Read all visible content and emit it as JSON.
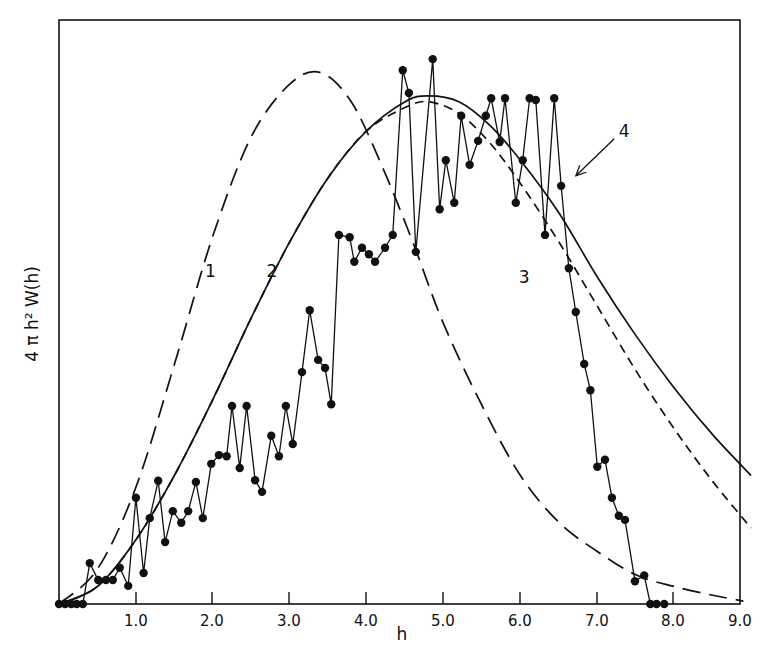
{
  "chart_data": {
    "type": "line",
    "title": "",
    "xlabel": "h",
    "ylabel": "4 π h² W(h)",
    "xlim": [
      0,
      9.0
    ],
    "ylim": [
      0,
      100
    ],
    "y_units": "relative (arbitrary, no tick labels shown)",
    "grid": false,
    "legend": "inline numeric labels 1-4",
    "x_ticks": [
      "1.0",
      "2.0",
      "3.0",
      "4.0",
      "5.0",
      "6.0",
      "7.0",
      "8.0",
      "9.0"
    ],
    "series": [
      {
        "name": "1",
        "style": "long-dashed",
        "description": "bell curve peaking near h=3.4",
        "x": [
          0,
          0.5,
          1.0,
          1.5,
          2.0,
          2.5,
          3.0,
          3.4,
          3.8,
          4.2,
          4.6,
          5.0,
          5.5,
          6.0,
          6.5,
          7.0,
          7.5,
          8.0,
          8.5,
          8.9
        ],
        "values": [
          0,
          6,
          20,
          41,
          63,
          80,
          89,
          91,
          86,
          75,
          62,
          48,
          34,
          22,
          14,
          9,
          5,
          3,
          1.5,
          0.5
        ]
      },
      {
        "name": "2",
        "style": "solid",
        "description": "broad curve peaking near h=4.8",
        "x": [
          0,
          0.5,
          1.0,
          1.5,
          2.0,
          2.5,
          3.0,
          3.5,
          4.0,
          4.5,
          4.8,
          5.2,
          5.6,
          6.0,
          6.5,
          7.0,
          7.5,
          8.0,
          8.5,
          9.0
        ],
        "values": [
          0,
          3,
          11,
          22,
          35,
          49,
          62,
          73,
          81,
          86,
          87,
          86,
          82,
          76,
          67,
          56,
          46,
          37,
          29,
          22
        ]
      },
      {
        "name": "3",
        "style": "short-dashed",
        "description": "curve close to 2 but falling faster after peak",
        "x": [
          0,
          0.5,
          1.0,
          1.5,
          2.0,
          2.5,
          3.0,
          3.5,
          4.0,
          4.5,
          4.8,
          5.2,
          5.6,
          6.0,
          6.5,
          7.0,
          7.5,
          8.0,
          8.5,
          9.0
        ],
        "values": [
          0,
          3,
          11,
          22,
          35,
          49,
          62,
          73,
          81,
          85,
          86,
          84,
          79,
          72,
          62,
          51,
          40,
          30,
          21,
          13
        ]
      },
      {
        "name": "4",
        "style": "solid with filled circle markers",
        "description": "jagged measured histogram points",
        "x": [
          0.0,
          0.08,
          0.16,
          0.23,
          0.31,
          0.4,
          0.51,
          0.61,
          0.7,
          0.79,
          0.9,
          1.0,
          1.1,
          1.18,
          1.29,
          1.38,
          1.48,
          1.59,
          1.68,
          1.78,
          1.87,
          1.98,
          2.08,
          2.18,
          2.25,
          2.35,
          2.44,
          2.55,
          2.64,
          2.76,
          2.86,
          2.95,
          3.04,
          3.16,
          3.26,
          3.37,
          3.46,
          3.54,
          3.64,
          3.78,
          3.84,
          3.94,
          4.03,
          4.11,
          4.24,
          4.34,
          4.47,
          4.55,
          4.64,
          4.86,
          4.95,
          5.03,
          5.14,
          5.23,
          5.34,
          5.45,
          5.55,
          5.62,
          5.73,
          5.8,
          5.94,
          6.03,
          6.12,
          6.2,
          6.32,
          6.44,
          6.53,
          6.63,
          6.72,
          6.83,
          6.91,
          7.0,
          7.1,
          7.19,
          7.28,
          7.36,
          7.49,
          7.61,
          7.69,
          7.77,
          7.87
        ],
        "values": [
          0,
          0,
          0,
          0,
          0,
          7.0,
          4.1,
          4.1,
          4.1,
          6.2,
          3.1,
          18.2,
          5.3,
          14.7,
          21.1,
          10.6,
          15.9,
          13.9,
          15.9,
          20.9,
          14.7,
          24.0,
          25.5,
          25.3,
          33.9,
          23.3,
          33.9,
          21.2,
          19.2,
          28.8,
          25.3,
          33.9,
          27.4,
          39.7,
          50.3,
          41.8,
          40.4,
          34.2,
          63.2,
          62.8,
          58.6,
          61.0,
          59.9,
          58.6,
          61.0,
          63.2,
          91.4,
          87.5,
          60.3,
          93.3,
          67.6,
          76.0,
          68.7,
          83.6,
          75.2,
          79.3,
          83.6,
          86.6,
          79.1,
          86.6,
          68.7,
          76.0,
          86.6,
          86.3,
          63.2,
          86.6,
          71.6,
          57.5,
          50.0,
          41.1,
          36.6,
          23.5,
          24.7,
          18.2,
          15.1,
          14.4,
          3.9,
          4.9,
          0,
          0,
          0
        ]
      }
    ],
    "annotations": [
      {
        "text": "1",
        "near_series": "1",
        "x": 1.97,
        "y": 56
      },
      {
        "text": "2",
        "near_series": "2",
        "x": 2.77,
        "y": 56
      },
      {
        "text": "3",
        "near_series": "3",
        "x": 6.05,
        "y": 55
      },
      {
        "text": "4",
        "near_series": "4",
        "x": 7.35,
        "y": 80,
        "arrow_to": {
          "x": 6.67,
          "y": 73
        }
      }
    ]
  },
  "axes": {
    "x_title": "h",
    "y_title": "4 π h² W(h)"
  },
  "pixel_layout": {
    "frame": {
      "left": 59,
      "top": 20,
      "right": 740,
      "bottom": 604
    },
    "x_px_per_unit": 76.9,
    "tick_px": [
      136,
      212,
      289,
      366,
      443,
      520,
      597,
      673,
      740
    ]
  }
}
